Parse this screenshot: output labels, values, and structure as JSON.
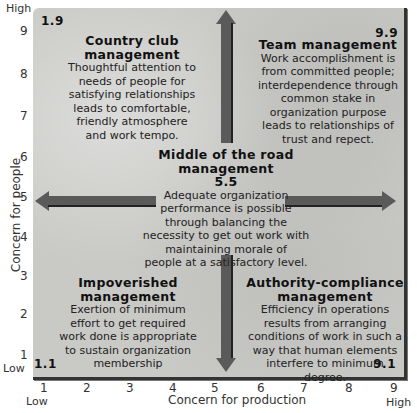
{
  "diagram": {
    "y_axis": {
      "title": "Concern for people",
      "high_label": "High",
      "low_label": "Low",
      "ticks": [
        "9",
        "8",
        "7",
        "6",
        "5",
        "4",
        "3",
        "2",
        "1"
      ]
    },
    "x_axis": {
      "title": "Concern for production",
      "high_label": "High",
      "low_label": "Low",
      "ticks": [
        "1",
        "2",
        "3",
        "4",
        "5",
        "6",
        "7",
        "8",
        "9"
      ]
    },
    "corners": {
      "top_left": "1.9",
      "top_right": "9.9",
      "bottom_left": "1.1",
      "bottom_right": "9.1"
    },
    "styles": [
      {
        "id": "country-club",
        "title_line1": "Country club",
        "title_line2": "management",
        "body": [
          "Thoughtful attention to",
          "needs of people for",
          "satisfying relationships",
          "leads to comfortable,",
          "friendly atmosphere",
          "and work tempo."
        ]
      },
      {
        "id": "team",
        "title_line1": "Team management",
        "title_line2": "",
        "body": [
          "Work accomplishment is",
          "from committed people;",
          "interdependence through",
          "common stake in",
          "organization purpose",
          "leads to relationships of",
          "trust and repect."
        ]
      },
      {
        "id": "middle-of-the-road",
        "title_line1": "Middle of the road",
        "title_line2": "management",
        "score": "5.5",
        "body": [
          "Adequate organization",
          "performance is possible",
          "through balancing the",
          "necessity to get out work with",
          "maintaining morale of",
          "people at a satisfactory level."
        ]
      },
      {
        "id": "impoverished",
        "title_line1": "Impoverished",
        "title_line2": "management",
        "body": [
          "Exertion of minimum",
          "effort to get required",
          "work done is appropriate",
          "to sustain organization",
          "membership"
        ]
      },
      {
        "id": "authority-compliance",
        "title_line1": "Authority-compliance",
        "title_line2": "management",
        "body": [
          "Efficiency in operations",
          "results from arranging",
          "conditions of work in such a",
          "way that human elements",
          "interfere to minimum",
          "degree."
        ]
      }
    ],
    "colors": {
      "panel": "#c9c9c6",
      "arrow": "#5a5a5a",
      "text": "#1a1a1a"
    }
  }
}
